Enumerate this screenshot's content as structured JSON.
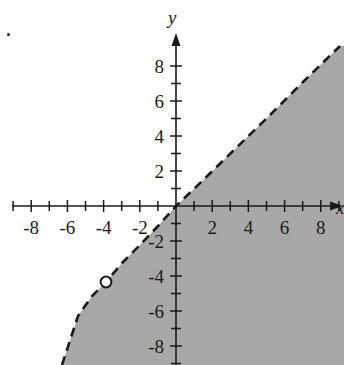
{
  "figure": {
    "title": "",
    "background_color": "#ffffff",
    "axis_color": "#1a1a1a",
    "shade_color": "#a8a8a8",
    "boundary_color": "#1a1a1a",
    "marker_fill": "#ffffff",
    "corner_dot": "•"
  },
  "axes": {
    "x_label": "x",
    "y_label": "y",
    "x_ticks_labeled": [
      "-8",
      "-6",
      "-4",
      "-2",
      "2",
      "4",
      "6",
      "8"
    ],
    "y_ticks_labeled": [
      "8",
      "6",
      "4",
      "2",
      "-2",
      "-4",
      "-6",
      "-8"
    ],
    "x_tick_values": [
      -8,
      -6,
      -4,
      -2,
      2,
      4,
      6,
      8
    ],
    "y_tick_values": [
      8,
      6,
      4,
      2,
      -2,
      -4,
      -6,
      -8
    ],
    "x_minor_ticks": [
      -9,
      -8,
      -7,
      -6,
      -5,
      -4,
      -3,
      -2,
      -1,
      1,
      2,
      3,
      4,
      5,
      6,
      7,
      8,
      9
    ],
    "y_minor_ticks": [
      8,
      7,
      6,
      5,
      4,
      3,
      2,
      1,
      -1,
      -2,
      -3,
      -4,
      -5,
      -6,
      -7,
      -8,
      -9
    ]
  },
  "chart_data": {
    "type": "line",
    "title": "",
    "xlabel": "x",
    "ylabel": "y",
    "xlim": [
      -9.7,
      9.3
    ],
    "ylim": [
      -9.1,
      9.1
    ],
    "grid": false,
    "legend": "none",
    "series": [
      {
        "name": "boundary",
        "style": "dashed",
        "color": "#1a1a1a",
        "description": "Dashed boundary line of the inequality; region to the right/below is shaded.",
        "x": [
          -6.2,
          -5.0,
          -3.9,
          -3.0,
          -2.2,
          -1.5,
          -0.8,
          0.0,
          1.0,
          3.0,
          5.0,
          7.0,
          9.1
        ],
        "y": [
          -9.1,
          -7.6,
          -6.3,
          -5.1,
          -4.1,
          -3.0,
          -1.8,
          0.0,
          0.9,
          2.9,
          4.8,
          6.7,
          8.6
        ]
      }
    ],
    "shaded_region": {
      "label": "solution set",
      "fill": "#a8a8a8",
      "side": "below-right of the dashed boundary",
      "boundary_included": false
    },
    "annotations": [
      {
        "type": "open-circle",
        "x": -4,
        "y": -4,
        "label": "",
        "note": "open point on the dashed boundary at (-4, -4)"
      }
    ]
  },
  "x_tick_labels": [
    {
      "text": "-8",
      "x": -8
    },
    {
      "text": "-6",
      "x": -6
    },
    {
      "text": "-4",
      "x": -4
    },
    {
      "text": "-2",
      "x": -2
    },
    {
      "text": "2",
      "x": 2
    },
    {
      "text": "4",
      "x": 4
    },
    {
      "text": "6",
      "x": 6
    },
    {
      "text": "8",
      "x": 8
    }
  ],
  "y_tick_labels": [
    {
      "text": "8",
      "y": 8
    },
    {
      "text": "6",
      "y": 6
    },
    {
      "text": "4",
      "y": 4
    },
    {
      "text": "2",
      "y": 2
    },
    {
      "text": "-2",
      "y": -2
    },
    {
      "text": "-4",
      "y": -4
    },
    {
      "text": "-6",
      "y": -6
    },
    {
      "text": "-8",
      "y": -8
    }
  ]
}
